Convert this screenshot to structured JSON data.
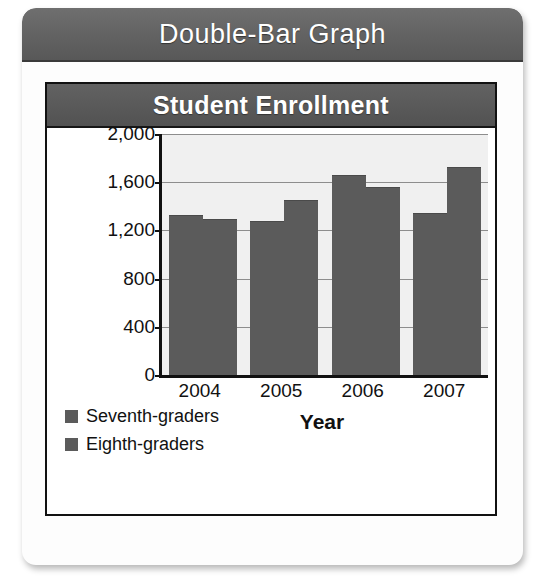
{
  "card": {
    "header_title": "Double-Bar Graph"
  },
  "chart_data": {
    "type": "bar",
    "title": "Student Enrollment",
    "xlabel": "Year",
    "ylabel": "Number of students",
    "categories": [
      "2004",
      "2005",
      "2006",
      "2007"
    ],
    "series": [
      {
        "name": "Seventh-graders",
        "values": [
          1320,
          1270,
          1650,
          1340
        ],
        "color": "#5b5b5b"
      },
      {
        "name": "Eighth-graders",
        "values": [
          1290,
          1440,
          1550,
          1720
        ],
        "color": "#5b5b5b"
      }
    ],
    "ylim": [
      0,
      2000
    ],
    "yticks": [
      0,
      400,
      800,
      1200,
      1600,
      2000
    ],
    "ytick_labels": [
      "0",
      "400",
      "800",
      "1,200",
      "1,600",
      "2,000"
    ],
    "grid": true,
    "legend_position": "bottom-left"
  }
}
